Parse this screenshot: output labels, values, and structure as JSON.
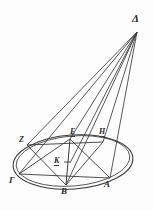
{
  "figure": {
    "background_color": "#fdfdfd",
    "ink_color": "#3a3a3a",
    "label_color": "#2b2b2b",
    "width": 153,
    "height": 211,
    "faint_top_mark": "·"
  },
  "points": [
    {
      "id": "delta",
      "label": "Δ",
      "x": 137,
      "y": 32,
      "label_x": 132,
      "label_y": 13,
      "font_size": 11,
      "underlined": false
    },
    {
      "id": "zeta",
      "label": "Z",
      "x": 27,
      "y": 145,
      "label_x": 19,
      "label_y": 136,
      "font_size": 8,
      "underlined": false
    },
    {
      "id": "epsilon",
      "label": "E",
      "x": 70,
      "y": 139,
      "label_x": 70,
      "label_y": 128,
      "font_size": 8,
      "underlined": true
    },
    {
      "id": "eta",
      "label": "H",
      "x": 103,
      "y": 142,
      "label_x": 99,
      "label_y": 128,
      "font_size": 8,
      "underlined": true
    },
    {
      "id": "kappa",
      "label": "K",
      "x": 70,
      "y": 163,
      "label_x": 54,
      "label_y": 157,
      "font_size": 8,
      "underlined": true
    },
    {
      "id": "gamma",
      "label": "Γ",
      "x": 19,
      "y": 174,
      "label_x": 9,
      "label_y": 176,
      "font_size": 9,
      "underlined": false
    },
    {
      "id": "beta",
      "label": "B",
      "x": 66,
      "y": 185,
      "label_x": 61,
      "label_y": 187,
      "font_size": 9,
      "underlined": false
    },
    {
      "id": "alpha",
      "label": "A",
      "x": 110,
      "y": 178,
      "label_x": 104,
      "label_y": 180,
      "font_size": 9,
      "underlined": false
    }
  ],
  "ellipses": [
    {
      "id": "base-ellipse",
      "cx": 73,
      "cy": 162,
      "rx": 60,
      "ry": 27,
      "rotation": -4
    },
    {
      "id": "section-ellipse",
      "cx": 73,
      "cy": 161,
      "rx": 57,
      "ry": 25,
      "rotation": -5
    }
  ],
  "lines": [
    {
      "id": "delta-to-gamma",
      "from": "delta",
      "to": "gamma"
    },
    {
      "id": "delta-to-zeta",
      "from": "delta",
      "to": "zeta"
    },
    {
      "id": "delta-to-beta",
      "from": "delta",
      "to": "beta"
    },
    {
      "id": "delta-to-kappa",
      "from": "delta",
      "to": "kappa"
    },
    {
      "id": "delta-to-epsilon",
      "from": "delta",
      "to": "epsilon"
    },
    {
      "id": "delta-to-alpha",
      "from": "delta",
      "to": "alpha"
    },
    {
      "id": "delta-to-eta",
      "from": "delta",
      "to": "eta"
    },
    {
      "id": "chord-gamma-alpha",
      "from": "gamma",
      "to": "alpha"
    },
    {
      "id": "chord-zeta-eta",
      "from": "zeta",
      "to": "eta"
    },
    {
      "id": "chord-gamma-epsilon",
      "from": "gamma",
      "to": "epsilon"
    },
    {
      "id": "chord-epsilon-alpha",
      "from": "epsilon",
      "to": "alpha"
    },
    {
      "id": "chord-zeta-beta",
      "from": "zeta",
      "to": "beta"
    },
    {
      "id": "chord-beta-eta",
      "from": "beta",
      "to": "eta"
    },
    {
      "id": "axis-epsilon-beta",
      "from": "epsilon",
      "to": "beta"
    }
  ],
  "tick_marks": [
    {
      "id": "kappa-tick",
      "x1": 64,
      "y1": 162,
      "x2": 70,
      "y2": 162
    }
  ]
}
